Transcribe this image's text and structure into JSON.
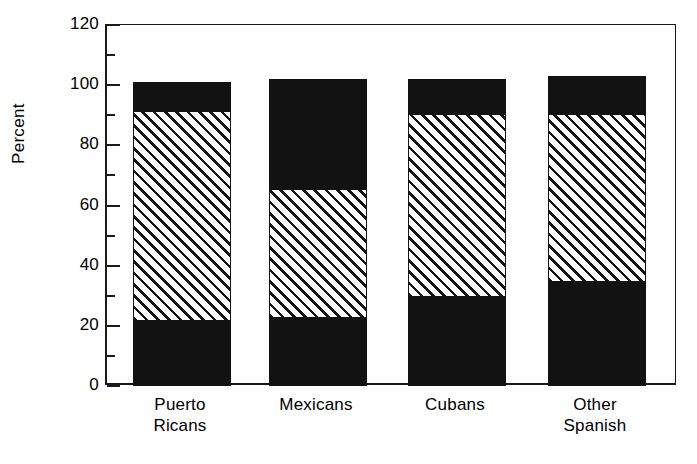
{
  "chart_data": {
    "type": "bar",
    "subtype": "stacked-bar",
    "title": "",
    "xlabel": "",
    "ylabel": "Percent",
    "ylim": [
      0,
      120
    ],
    "ytick_major_step": 20,
    "ytick_minor_step": 10,
    "ytick_labels": [
      "0",
      "20",
      "40",
      "60",
      "80",
      "100",
      "120"
    ],
    "ytick_values": [
      0,
      20,
      40,
      60,
      80,
      100,
      120
    ],
    "grid": false,
    "legend": "none",
    "categories": [
      "Puerto\nRicans",
      "Mexicans",
      "Cubans",
      "Other\nSpanish"
    ],
    "category_names": [
      "Puerto Ricans",
      "Mexicans",
      "Cubans",
      "Other Spanish"
    ],
    "series": [
      {
        "name": "bottom-segment",
        "fill": "solid-black",
        "values": [
          22,
          23,
          30,
          35
        ]
      },
      {
        "name": "middle-segment",
        "fill": "diagonal-hatch",
        "values": [
          69,
          42,
          60,
          55
        ]
      },
      {
        "name": "top-segment",
        "fill": "solid-black",
        "values": [
          10,
          37,
          12,
          13
        ]
      }
    ],
    "cumulative_tops": [
      [
        22,
        91,
        101
      ],
      [
        23,
        65,
        102
      ],
      [
        30,
        90,
        102
      ],
      [
        35,
        90,
        103
      ]
    ],
    "colors": {
      "solid": "#121212",
      "hatch_line": "#141414",
      "hatch_background": "#ffffff",
      "axis": "#1a1a1a"
    }
  }
}
